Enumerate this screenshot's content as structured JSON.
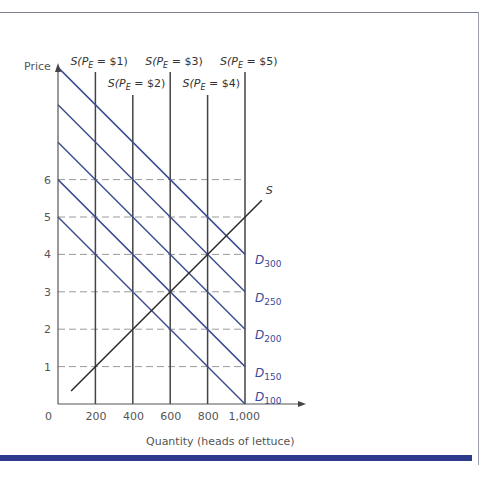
{
  "chart_data": {
    "type": "line",
    "title": "",
    "xlabel": "Quantity (heads of lettuce)",
    "ylabel": "Price",
    "xlim": [
      0,
      1100
    ],
    "ylim": [
      0,
      9
    ],
    "x_ticks": [
      "0",
      "200",
      "400",
      "600",
      "800",
      "1,000"
    ],
    "y_ticks": [
      "1",
      "2",
      "3",
      "4",
      "5",
      "6"
    ],
    "grid": "dashed horizontal lines at prices 1-6",
    "vertical_supply_curves": [
      {
        "name": "S(P_E = $1)",
        "label_main": "S(P",
        "label_sub": "E",
        "label_tail": " = $1)",
        "quantity": 200
      },
      {
        "name": "S(P_E = $2)",
        "label_main": "S(P",
        "label_sub": "E",
        "label_tail": " = $2)",
        "quantity": 400
      },
      {
        "name": "S(P_E = $3)",
        "label_main": "S(P",
        "label_sub": "E",
        "label_tail": " = $3)",
        "quantity": 600
      },
      {
        "name": "S(P_E = $4)",
        "label_main": "S(P",
        "label_sub": "E",
        "label_tail": " = $4)",
        "quantity": 800
      },
      {
        "name": "S(P_E = $5)",
        "label_main": "S(P",
        "label_sub": "E",
        "label_tail": " = $5)",
        "quantity": 1000
      }
    ],
    "demand_curves": [
      {
        "name": "D100",
        "label": "D",
        "sub": "100",
        "points": [
          [
            0,
            5
          ],
          [
            1000,
            0
          ]
        ]
      },
      {
        "name": "D150",
        "label": "D",
        "sub": "150",
        "points": [
          [
            0,
            6
          ],
          [
            1000,
            1
          ]
        ]
      },
      {
        "name": "D200",
        "label": "D",
        "sub": "200",
        "points": [
          [
            0,
            7
          ],
          [
            1000,
            2
          ]
        ]
      },
      {
        "name": "D250",
        "label": "D",
        "sub": "250",
        "points": [
          [
            0,
            8
          ],
          [
            1000,
            3
          ]
        ]
      },
      {
        "name": "D300",
        "label": "D",
        "sub": "300",
        "points": [
          [
            0,
            9
          ],
          [
            1000,
            4
          ]
        ]
      }
    ],
    "supply_curve": {
      "name": "S",
      "label": "S",
      "points": [
        [
          70,
          0.35
        ],
        [
          200,
          1
        ],
        [
          400,
          2
        ],
        [
          600,
          3
        ],
        [
          800,
          4
        ],
        [
          1090,
          5.45
        ]
      ]
    },
    "colors": {
      "demand": "#3a4a8f",
      "supply": "#2a2a2a",
      "grid": "#9a9a9a",
      "axis": "#555555",
      "frame_bar": "#2e3a8c"
    }
  }
}
